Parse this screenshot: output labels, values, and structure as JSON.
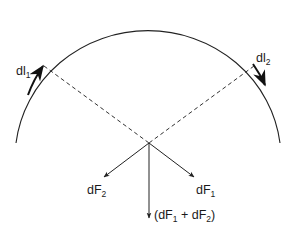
{
  "diagram": {
    "colors": {
      "stroke": "#222222",
      "dashed": "#333333",
      "background": "#ffffff"
    },
    "elements": {
      "dl1": {
        "base": "dl",
        "sub": "1"
      },
      "dl2": {
        "base": "dl",
        "sub": "2"
      },
      "dF1": {
        "base": "dF",
        "sub": "1"
      },
      "dF2": {
        "base": "dF",
        "sub": "2"
      },
      "sum": {
        "open": "(dF",
        "sub1": "1",
        "mid": " + dF",
        "sub2": "2",
        "close": ")"
      }
    }
  }
}
